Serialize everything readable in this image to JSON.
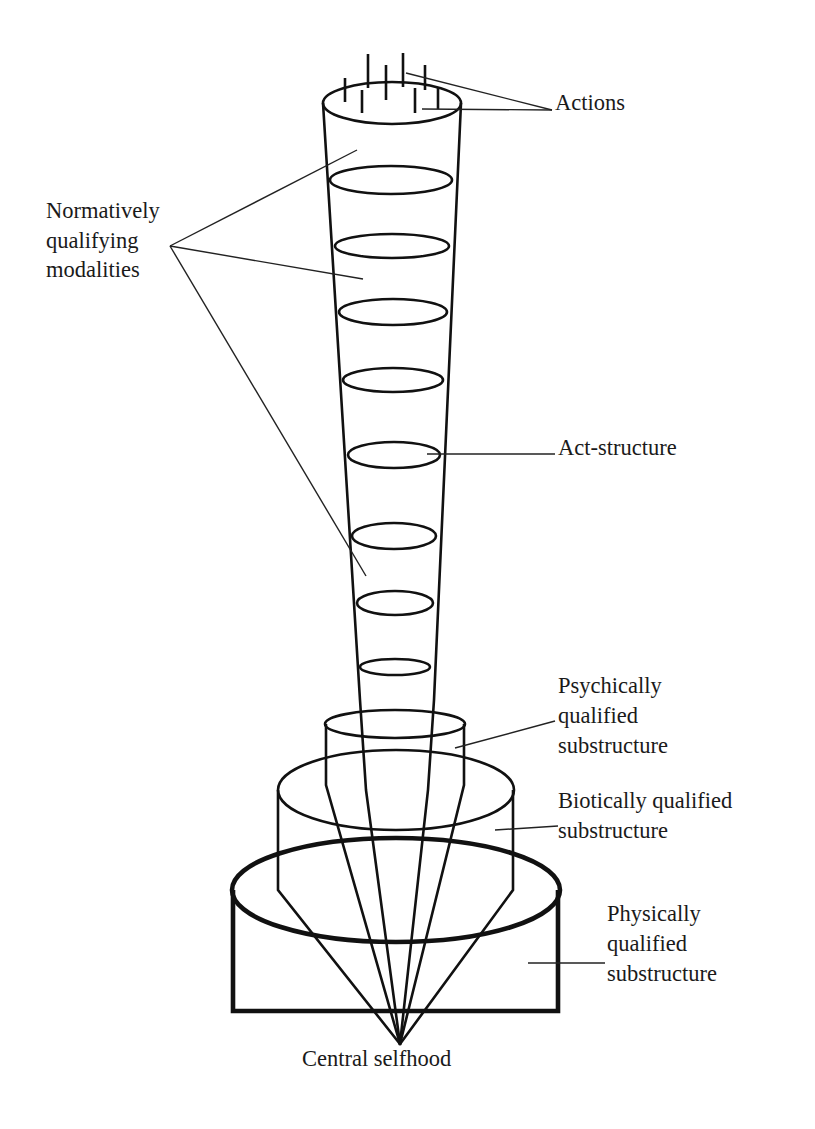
{
  "diagram": {
    "labels": {
      "actions": "Actions",
      "normative": [
        "Normatively",
        "qualifying",
        "modalities"
      ],
      "act_structure": "Act-structure",
      "psychic": [
        "Psychically",
        "qualified",
        "substructure"
      ],
      "biotic": [
        "Biotically qualified",
        "substructure"
      ],
      "physical": [
        "Physically",
        "qualified",
        "substructure"
      ],
      "center": "Central selfhood"
    },
    "components": [
      {
        "name": "actions",
        "description": "vertical strokes rising from top of tube"
      },
      {
        "name": "act-structure",
        "description": "tapering tube with stacked modality rings",
        "ring_count": 8
      },
      {
        "name": "psychically-qualified-substructure",
        "description": "small cylinder"
      },
      {
        "name": "biotically-qualified-substructure",
        "description": "middle cylinder"
      },
      {
        "name": "physically-qualified-substructure",
        "description": "large base cylinder, heavy outline"
      },
      {
        "name": "central-selfhood",
        "description": "apex point where all lines converge"
      }
    ],
    "colors": {
      "ink": "#111111",
      "background": "#ffffff"
    }
  }
}
